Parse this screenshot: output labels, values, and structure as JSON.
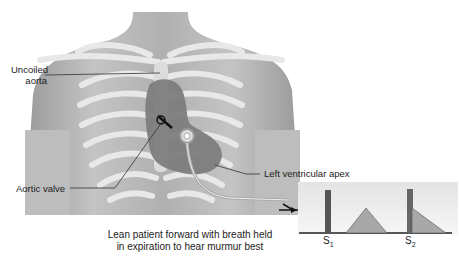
{
  "labels": {
    "uncoiled_aorta_line1": "Uncoiled",
    "uncoiled_aorta_line2": "aorta",
    "aortic_valve": "Aortic valve",
    "left_ventricular_apex": "Left ventricular apex"
  },
  "caption": {
    "line1": "Lean patient forward with breath held",
    "line2": "in expiration to hear murmur best"
  },
  "phonocardiogram": {
    "s1_label": "S",
    "s1_sub": "1",
    "s2_label": "S",
    "s2_sub": "2",
    "description": "S1 spike, mid-systolic crescendo-decrescendo murmur, S2 spike followed by early diastolic decrescendo murmur"
  },
  "colors": {
    "skin": "#b9b9b9",
    "rib": "#e6e6e6",
    "heart": "#7d7d7d",
    "murmur": "#a8a8a8",
    "spike": "#555555",
    "background": "#ffffff"
  }
}
